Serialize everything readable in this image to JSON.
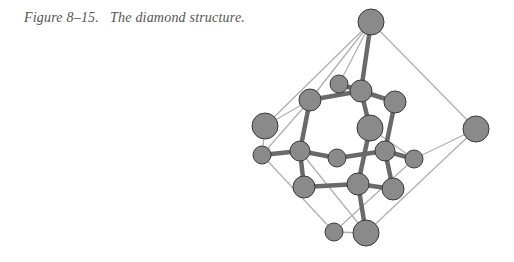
{
  "figure": {
    "caption": "Figure 8–15.   The diamond structure.",
    "colors": {
      "atom_fill": "#8a8a8a",
      "atom_outline": "#3a3a3a",
      "bond": "#6a6a6a",
      "cell_edge": "#b0b0b0",
      "caption_text": "#555555"
    },
    "atoms": [
      {
        "id": "a0",
        "role": "corner-top"
      },
      {
        "id": "a1",
        "role": "small-back"
      },
      {
        "id": "a2",
        "role": "inner"
      },
      {
        "id": "a3",
        "role": "face"
      },
      {
        "id": "a4",
        "role": "face"
      },
      {
        "id": "a5",
        "role": "corner-left"
      },
      {
        "id": "a6",
        "role": "face-center"
      },
      {
        "id": "a7",
        "role": "corner-right"
      },
      {
        "id": "a8",
        "role": "small-left"
      },
      {
        "id": "a9",
        "role": "inner"
      },
      {
        "id": "a10",
        "role": "small-back"
      },
      {
        "id": "a11",
        "role": "inner"
      },
      {
        "id": "a12",
        "role": "small-right"
      },
      {
        "id": "a13",
        "role": "face"
      },
      {
        "id": "a14",
        "role": "inner"
      },
      {
        "id": "a15",
        "role": "face"
      },
      {
        "id": "a16",
        "role": "small-bottom"
      },
      {
        "id": "a17",
        "role": "corner-bottom"
      }
    ],
    "bonds": [
      [
        "a0",
        "a2"
      ],
      [
        "a2",
        "a1"
      ],
      [
        "a2",
        "a3"
      ],
      [
        "a2",
        "a4"
      ],
      [
        "a2",
        "a6"
      ],
      [
        "a3",
        "a9"
      ],
      [
        "a4",
        "a11"
      ],
      [
        "a6",
        "a14"
      ],
      [
        "a8",
        "a9"
      ],
      [
        "a9",
        "a10"
      ],
      [
        "a10",
        "a11"
      ],
      [
        "a11",
        "a12"
      ],
      [
        "a9",
        "a13"
      ],
      [
        "a13",
        "a14"
      ],
      [
        "a14",
        "a15"
      ],
      [
        "a11",
        "a15"
      ],
      [
        "a14",
        "a17"
      ]
    ],
    "cell_edges": [
      [
        "a0",
        "a5"
      ],
      [
        "a0",
        "a7"
      ],
      [
        "a0",
        "a1"
      ],
      [
        "a0",
        "a3"
      ],
      [
        "a5",
        "a8"
      ],
      [
        "a5",
        "a3"
      ],
      [
        "a8",
        "a16"
      ],
      [
        "a7",
        "a12"
      ],
      [
        "a7",
        "a17"
      ],
      [
        "a16",
        "a17"
      ],
      [
        "a9",
        "a17"
      ],
      [
        "a8",
        "a3"
      ],
      [
        "a12",
        "a16"
      ],
      [
        "a6",
        "a12"
      ]
    ]
  }
}
